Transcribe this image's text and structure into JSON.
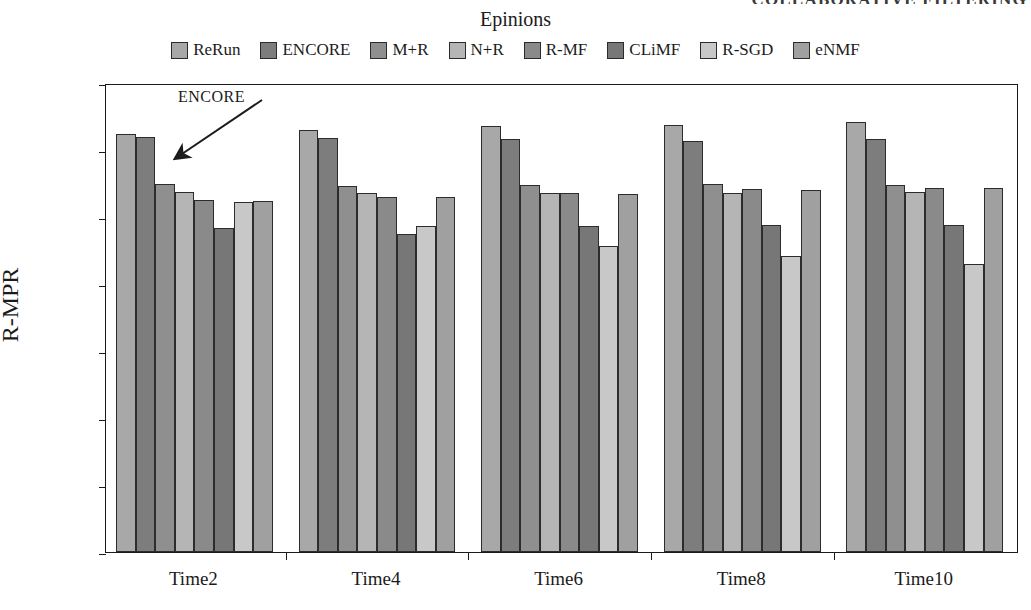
{
  "running_header": {
    "text": "COLLABORATIVE FILTERING"
  },
  "chart_title": "Epinions",
  "annotation": {
    "label": "ENCORE"
  },
  "legend": {
    "items": [
      {
        "label": "ReRun",
        "color": "#a8a8a8"
      },
      {
        "label": "ENCORE",
        "color": "#7d7d7d"
      },
      {
        "label": "M+R",
        "color": "#8f8f8f"
      },
      {
        "label": "N+R",
        "color": "#b5b5b5"
      },
      {
        "label": "R-MF",
        "color": "#8a8a8a"
      },
      {
        "label": "CLiMF",
        "color": "#777777"
      },
      {
        "label": "R-SGD",
        "color": "#c8c8c8"
      },
      {
        "label": "eNMF",
        "color": "#a0a0a0"
      }
    ]
  },
  "axes": {
    "y_title": "R-MPR",
    "y_ticks": [
      "0.00",
      "0.05",
      "0.10",
      "0.15",
      "0.20",
      "0.25",
      "0.30",
      "0.35"
    ],
    "x_ticks": [
      "Time2",
      "Time4",
      "Time6",
      "Time8",
      "Time10"
    ]
  },
  "chart_data": {
    "type": "bar",
    "title": "Epinions",
    "xlabel": "",
    "ylabel": "R-MPR",
    "ylim": [
      0.0,
      0.35
    ],
    "ytick_step": 0.05,
    "grid": false,
    "legend_position": "top",
    "categories": [
      "Time2",
      "Time4",
      "Time6",
      "Time8",
      "Time10"
    ],
    "series": [
      {
        "name": "ReRun",
        "color": "#a8a8a8",
        "values": [
          0.312,
          0.315,
          0.318,
          0.319,
          0.321
        ]
      },
      {
        "name": "ENCORE",
        "color": "#7d7d7d",
        "values": [
          0.31,
          0.309,
          0.308,
          0.307,
          0.308
        ]
      },
      {
        "name": "M+R",
        "color": "#8f8f8f",
        "values": [
          0.275,
          0.273,
          0.274,
          0.275,
          0.274
        ]
      },
      {
        "name": "N+R",
        "color": "#b5b5b5",
        "values": [
          0.269,
          0.268,
          0.268,
          0.268,
          0.269
        ]
      },
      {
        "name": "R-MF",
        "color": "#8a8a8a",
        "values": [
          0.263,
          0.265,
          0.268,
          0.271,
          0.272
        ]
      },
      {
        "name": "CLiMF",
        "color": "#777777",
        "values": [
          0.242,
          0.237,
          0.243,
          0.244,
          0.244
        ]
      },
      {
        "name": "R-SGD",
        "color": "#c8c8c8",
        "values": [
          0.261,
          0.243,
          0.228,
          0.221,
          0.215
        ]
      },
      {
        "name": "eNMF",
        "color": "#a0a0a0",
        "values": [
          0.262,
          0.265,
          0.267,
          0.27,
          0.272
        ]
      }
    ],
    "annotations": [
      {
        "text": "ENCORE",
        "points_to": {
          "category": "Time2",
          "series": "ENCORE"
        }
      }
    ]
  }
}
